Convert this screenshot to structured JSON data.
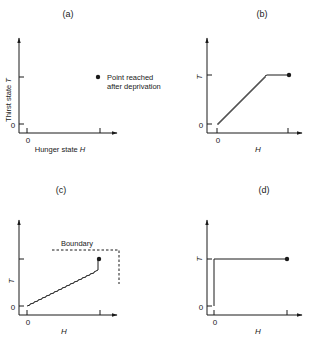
{
  "panels": {
    "a": {
      "title": "(a)",
      "y_label": "Thirst state",
      "y_symbol": "T",
      "x_label": "Hunger state",
      "x_symbol": "H",
      "y_zero": "0",
      "x_zero": "0",
      "legend_line1": "Point reached",
      "legend_line2": "after deprivation"
    },
    "b": {
      "title": "(b)",
      "y_symbol": "T",
      "x_symbol": "H",
      "y_zero": "0",
      "x_zero": "0"
    },
    "c": {
      "title": "(c)",
      "y_symbol": "T",
      "x_symbol": "H",
      "y_zero": "0",
      "x_zero": "0",
      "boundary_label": "Boundary"
    },
    "d": {
      "title": "(d)",
      "y_symbol": "T",
      "x_symbol": "H",
      "y_zero": "0",
      "x_zero": "0"
    }
  },
  "colors": {
    "ink": "#1a1a1a",
    "background": "#ffffff"
  }
}
